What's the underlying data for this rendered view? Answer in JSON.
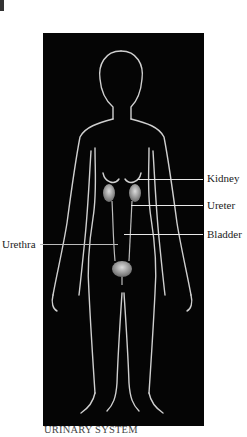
{
  "figure": {
    "caption": "URINARY SYSTEM",
    "labels": {
      "kidney": "Kidney",
      "ureter": "Ureter",
      "bladder": "Bladder",
      "urethra": "Urethra"
    }
  },
  "colors": {
    "background": "#ffffff",
    "panel": "#050505",
    "outline": "#d8d8d8",
    "organ": "#b5b5b5",
    "label_text": "#222222"
  }
}
